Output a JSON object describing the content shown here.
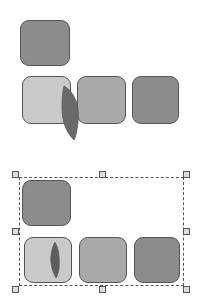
{
  "colors": {
    "dark_shape": "#8c8c8c",
    "mid_shape": "#a9a9a9",
    "light_shape": "#c9c9c9",
    "leaf": "#666666",
    "outline": "#555555",
    "handle_fill": "#dddddd"
  },
  "groups": [
    {
      "name": "unselected-group",
      "shapes": [
        "dark",
        "light",
        "mid",
        "dark"
      ],
      "leaf_overlaps": "between first and second bottom shapes"
    },
    {
      "name": "selected-group",
      "shapes": [
        "dark",
        "light",
        "mid",
        "dark"
      ],
      "leaf_inside": "first bottom shape",
      "selection_handles": 8
    }
  ]
}
